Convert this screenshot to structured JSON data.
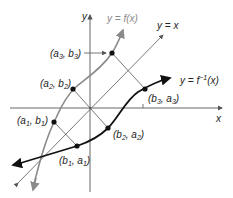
{
  "diagram": {
    "colors": {
      "axis": "#555555",
      "f_curve": "#8a8a8a",
      "finv_curve": "#111111",
      "line_y_eq_x": "#555555",
      "connectors": "#555555",
      "points": "#111111"
    },
    "axes": {
      "x_label": "x",
      "y_label": "y"
    },
    "curves": {
      "f": {
        "label": "y = f(x)"
      },
      "f_inverse": {
        "label_prefix": "y = f",
        "label_sup": "−1",
        "label_suffix": "(x)"
      },
      "identity": {
        "label": "y = x"
      }
    },
    "points": [
      {
        "id": "a3b3",
        "label_main1": "(a",
        "sub1": "3",
        "label_mid": ", b",
        "sub2": "3",
        "label_end": ")"
      },
      {
        "id": "a2b2",
        "label_main1": "(a",
        "sub1": "2",
        "label_mid": ", b",
        "sub2": "2",
        "label_end": ")"
      },
      {
        "id": "a1b1",
        "label_main1": "(a",
        "sub1": "1",
        "label_mid": ", b",
        "sub2": "1",
        "label_end": ")"
      },
      {
        "id": "b1a1",
        "label_main1": "(b",
        "sub1": "1",
        "label_mid": ", a",
        "sub2": "1",
        "label_end": ")"
      },
      {
        "id": "b2a2",
        "label_main1": "(b",
        "sub1": "2",
        "label_mid": ", a",
        "sub2": "2",
        "label_end": ")"
      },
      {
        "id": "b3a3",
        "label_main1": "(b",
        "sub1": "3",
        "label_mid": ", a",
        "sub2": "3",
        "label_end": ")"
      }
    ]
  }
}
